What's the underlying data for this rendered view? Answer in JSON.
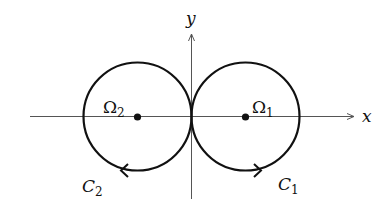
{
  "diagram": {
    "axes": {
      "x_label": "x",
      "y_label": "y"
    },
    "circles": [
      {
        "name": "C1",
        "curve_label": "C",
        "curve_subscript": "1",
        "region_label": "Ω",
        "region_subscript": "1",
        "center": [
          246,
          117
        ],
        "radius": 54,
        "orientation": "counterclockwise"
      },
      {
        "name": "C2",
        "curve_label": "C",
        "curve_subscript": "2",
        "region_label": "Ω",
        "region_subscript": "2",
        "center": [
          137,
          117
        ],
        "radius": 54,
        "orientation": "clockwise"
      }
    ],
    "colors": {
      "curve": "#111111",
      "axis": "#555555",
      "background": "#ffffff"
    }
  }
}
